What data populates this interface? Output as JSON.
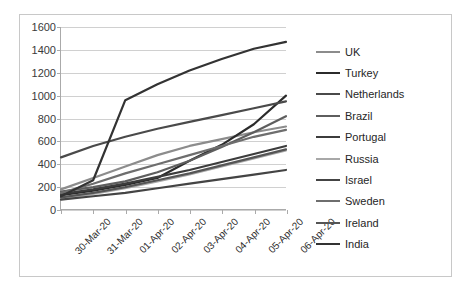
{
  "chart_data": {
    "type": "line",
    "title": "",
    "xlabel": "",
    "ylabel": "",
    "ylim": [
      0,
      1600
    ],
    "yticks": [
      0,
      200,
      400,
      600,
      800,
      1000,
      1200,
      1400,
      1600
    ],
    "grid": true,
    "legend_position": "right",
    "categories": [
      "30-Mar-20",
      "31-Mar-20",
      "01-Apr-20",
      "02-Apr-20",
      "03-Apr-20",
      "04-Apr-20",
      "05-Apr-20",
      "06-Apr-20"
    ],
    "series": [
      {
        "name": "UK",
        "color": "#8c8c8c",
        "width": 2.2,
        "values": [
          180,
          280,
          380,
          480,
          560,
          620,
          680,
          730
        ]
      },
      {
        "name": "Turkey",
        "color": "#2b2b2b",
        "width": 2.2,
        "values": [
          130,
          170,
          220,
          280,
          430,
          570,
          750,
          1000
        ]
      },
      {
        "name": "Netherlands",
        "color": "#4a4a4a",
        "width": 2.2,
        "values": [
          460,
          560,
          640,
          710,
          770,
          830,
          890,
          950
        ]
      },
      {
        "name": "Brazil",
        "color": "#5e5e5e",
        "width": 2.2,
        "values": [
          160,
          200,
          250,
          330,
          430,
          550,
          680,
          820
        ]
      },
      {
        "name": "Portugal",
        "color": "#3c3c3c",
        "width": 2.2,
        "values": [
          140,
          180,
          230,
          290,
          350,
          420,
          490,
          560
        ]
      },
      {
        "name": "Russia",
        "color": "#a8a8a8",
        "width": 2.2,
        "values": [
          100,
          140,
          190,
          250,
          310,
          380,
          450,
          520
        ]
      },
      {
        "name": "Israel",
        "color": "#444444",
        "width": 2.2,
        "values": [
          90,
          120,
          150,
          190,
          230,
          270,
          310,
          350
        ]
      },
      {
        "name": "Sweden",
        "color": "#6e6e6e",
        "width": 2.2,
        "values": [
          150,
          230,
          320,
          400,
          480,
          560,
          640,
          700
        ]
      },
      {
        "name": "Ireland",
        "color": "#555555",
        "width": 2.2,
        "values": [
          110,
          150,
          200,
          260,
          320,
          390,
          460,
          530
        ]
      },
      {
        "name": "India",
        "color": "#333333",
        "width": 2.2,
        "values": [
          120,
          260,
          960,
          1100,
          1220,
          1320,
          1410,
          1470
        ]
      }
    ]
  },
  "legend": {
    "items": [
      {
        "label": "UK"
      },
      {
        "label": "Turkey"
      },
      {
        "label": "Netherlands"
      },
      {
        "label": "Brazil"
      },
      {
        "label": "Portugal"
      },
      {
        "label": "Russia"
      },
      {
        "label": "Israel"
      },
      {
        "label": "Sweden"
      },
      {
        "label": "Ireland"
      },
      {
        "label": "India"
      }
    ]
  }
}
